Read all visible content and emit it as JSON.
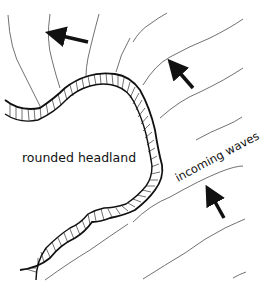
{
  "diagram": {
    "labels": {
      "headland": "rounded headland",
      "waves": "incoming waves"
    },
    "arrows": [
      {
        "name": "arrow-refracted-top-left",
        "direction": "west"
      },
      {
        "name": "arrow-refracted-top-right",
        "direction": "north-west"
      },
      {
        "name": "arrow-incoming-right",
        "direction": "north-north-west"
      }
    ],
    "colors": {
      "ink": "#111111",
      "background": "#ffffff"
    }
  }
}
